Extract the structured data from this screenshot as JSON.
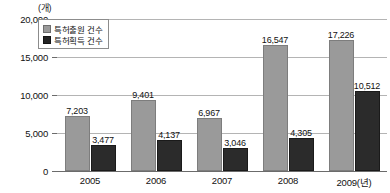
{
  "chart_data": {
    "type": "bar",
    "title": "",
    "subtitle": "",
    "unit_label": "(개)",
    "xlabel": "",
    "ylabel": "",
    "categories": [
      "2005",
      "2006",
      "2007",
      "2008",
      "2009(년)"
    ],
    "series": [
      {
        "name": "특허출원 건수",
        "color": "#9a9a9a",
        "values": [
          7203,
          9401,
          6967,
          16547,
          17226
        ],
        "value_labels": [
          "7,203",
          "9,401",
          "6,967",
          "16,547",
          "17,226"
        ]
      },
      {
        "name": "특허획득 건수",
        "color": "#2b2b2b",
        "values": [
          3477,
          4137,
          3046,
          4305,
          10512
        ],
        "value_labels": [
          "3,477",
          "4,137",
          "3,046",
          "4,305",
          "10,512"
        ]
      }
    ],
    "ylim": [
      0,
      20000
    ],
    "yticks": [
      0,
      5000,
      10000,
      15000,
      20000
    ],
    "ytick_labels": [
      "0",
      "5,000",
      "10,000",
      "15,000",
      "20,000"
    ],
    "grid": true,
    "legend_position": "upper-left"
  },
  "legend": {
    "items": [
      {
        "label": "특허출원 건수",
        "swatch": "light-gray-swatch"
      },
      {
        "label": "특허획득 건수",
        "swatch": "black-swatch"
      }
    ]
  }
}
